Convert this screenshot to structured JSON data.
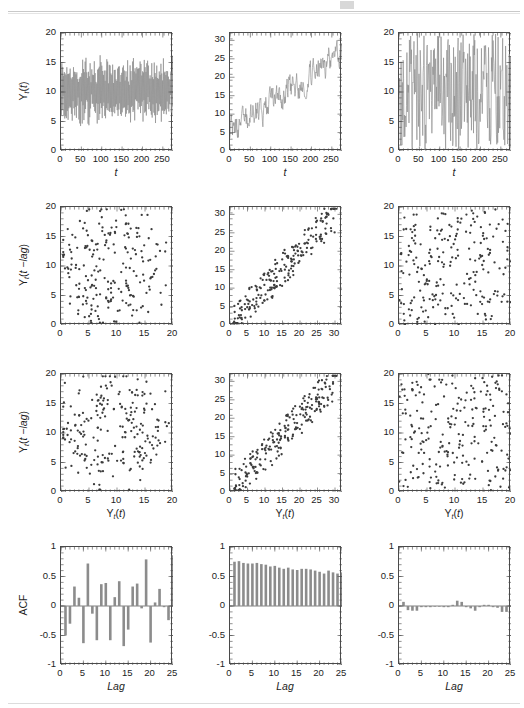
{
  "figure": {
    "type": "multi-panel-statistical-figure",
    "rows": 4,
    "cols": 3,
    "series_color": "#8c8c8c",
    "marker_color": "#3c3c3c",
    "axis_color": "#4a4a4a",
    "background": "#ffffff"
  },
  "labels": {
    "y_series": "Y",
    "y_series_sub": "t",
    "y_series_arg": "(t)",
    "y_lag": "Y",
    "y_lag_sub": "t",
    "y_lag_arg": "(t −lag)",
    "x_time": "t",
    "x_value": "Y",
    "x_value_sub": "t",
    "x_value_arg": "(t)",
    "acf": "ACF",
    "lag": "Lag"
  },
  "chart_data": [
    {
      "id": "r1c1",
      "type": "line",
      "title": "",
      "xlabel": "t",
      "ylabel": "Y_t(t)",
      "xlim": [
        0,
        275
      ],
      "ylim": [
        0,
        20
      ],
      "xticks": [
        0,
        50,
        100,
        150,
        200,
        250
      ],
      "yticks": [
        0,
        5,
        10,
        15,
        20
      ],
      "grid": false,
      "description": "stationary white-noise-like oscillating series centered near 10",
      "mean": 10.2,
      "n": 270,
      "amplitude": 9.0
    },
    {
      "id": "r1c2",
      "type": "line",
      "title": "",
      "xlabel": "t",
      "ylabel": "Y_t(t)",
      "xlim": [
        0,
        275
      ],
      "ylim": [
        0,
        32
      ],
      "xticks": [
        0,
        50,
        100,
        150,
        200,
        250
      ],
      "yticks": [
        0,
        5,
        10,
        15,
        20,
        25,
        30
      ],
      "grid": false,
      "description": "upward trending noisy random-walk series rising from about 5 to about 27",
      "start": 5,
      "end": 27,
      "n": 270,
      "noise": 3.0
    },
    {
      "id": "r1c3",
      "type": "line",
      "title": "",
      "xlabel": "t",
      "ylabel": "Y_t(t)",
      "xlim": [
        0,
        275
      ],
      "ylim": [
        0,
        20
      ],
      "xticks": [
        0,
        50,
        100,
        150,
        200,
        250
      ],
      "yticks": [
        0,
        5,
        10,
        15,
        20
      ],
      "grid": false,
      "description": "uniform random series filling the full 0 to 20 range",
      "mean": 10.0,
      "n": 270,
      "amplitude": 20.0
    },
    {
      "id": "r2c1",
      "type": "scatter",
      "title": "",
      "xlabel": "",
      "ylabel": "Y_t(t −lag)",
      "xlim": [
        0,
        20
      ],
      "ylim": [
        0,
        20
      ],
      "xticks": [
        0,
        5,
        10,
        15,
        20
      ],
      "yticks": [
        0,
        5,
        10,
        15,
        20
      ],
      "grid": false,
      "n_points": 220,
      "description": "lag-1 scatter showing curved/looping cloud structure, no simple linear trend"
    },
    {
      "id": "r2c2",
      "type": "scatter",
      "title": "",
      "xlabel": "",
      "ylabel": "Y_t(t −lag)",
      "xlim": [
        0,
        32
      ],
      "ylim": [
        0,
        32
      ],
      "xticks": [
        0,
        5,
        10,
        15,
        20,
        25,
        30
      ],
      "yticks": [
        0,
        5,
        10,
        15,
        20,
        25,
        30
      ],
      "grid": false,
      "n_points": 220,
      "description": "strong positive linear association along the diagonal"
    },
    {
      "id": "r2c3",
      "type": "scatter",
      "title": "",
      "xlabel": "",
      "ylabel": "Y_t(t −lag)",
      "xlim": [
        0,
        20
      ],
      "ylim": [
        0,
        20
      ],
      "xticks": [
        0,
        5,
        10,
        15,
        20
      ],
      "yticks": [
        0,
        5,
        10,
        15,
        20
      ],
      "grid": false,
      "n_points": 230,
      "description": "uniformly scattered cloud with no association"
    },
    {
      "id": "r3c1",
      "type": "scatter",
      "title": "",
      "xlabel": "Y_t(t)",
      "ylabel": "Y_t(t −lag)",
      "xlim": [
        0,
        20
      ],
      "ylim": [
        0,
        20
      ],
      "xticks": [
        0,
        5,
        10,
        15,
        20
      ],
      "yticks": [
        0,
        5,
        10,
        15,
        20
      ],
      "grid": false,
      "n_points": 220,
      "description": "lag-2 scatter showing weak negative / curved structure"
    },
    {
      "id": "r3c2",
      "type": "scatter",
      "title": "",
      "xlabel": "Y_t(t)",
      "ylabel": "Y_t(t −lag)",
      "xlim": [
        0,
        32
      ],
      "ylim": [
        0,
        32
      ],
      "xticks": [
        0,
        5,
        10,
        15,
        20,
        25,
        30
      ],
      "yticks": [
        0,
        5,
        10,
        15,
        20,
        25,
        30
      ],
      "grid": false,
      "n_points": 220,
      "description": "strong positive linear association along the diagonal"
    },
    {
      "id": "r3c3",
      "type": "scatter",
      "title": "",
      "xlabel": "Y_t(t)",
      "ylabel": "Y_t(t −lag)",
      "xlim": [
        0,
        20
      ],
      "ylim": [
        0,
        20
      ],
      "xticks": [
        0,
        5,
        10,
        15,
        20
      ],
      "yticks": [
        0,
        5,
        10,
        15,
        20
      ],
      "grid": false,
      "n_points": 230,
      "description": "uniformly scattered cloud with no association"
    },
    {
      "id": "r4c1",
      "type": "bar",
      "title": "",
      "xlabel": "Lag",
      "ylabel": "ACF",
      "xlim": [
        0,
        25
      ],
      "ylim": [
        -1,
        1
      ],
      "xticks": [
        0,
        5,
        10,
        15,
        20,
        25
      ],
      "yticks": [
        -1,
        -0.5,
        0,
        0.5,
        1
      ],
      "grid": false,
      "categories": [
        1,
        2,
        3,
        4,
        5,
        6,
        7,
        8,
        9,
        10,
        11,
        12,
        13,
        14,
        15,
        16,
        17,
        18,
        19,
        20,
        21,
        22,
        23,
        24,
        25
      ],
      "values": [
        -0.5,
        -0.3,
        0.33,
        0.14,
        -0.63,
        0.72,
        -0.13,
        -0.58,
        0.37,
        0.39,
        -0.58,
        0.15,
        0.42,
        -0.68,
        -0.4,
        0.33,
        0.38,
        -0.04,
        0.79,
        -0.62,
        0.06,
        0.29,
        -0.02,
        -0.24,
        0.86
      ],
      "description": "strongly oscillating ACF of a periodic/deterministic series"
    },
    {
      "id": "r4c2",
      "type": "bar",
      "title": "",
      "xlabel": "Lag",
      "ylabel": "ACF",
      "xlim": [
        0,
        25
      ],
      "ylim": [
        -1,
        1
      ],
      "xticks": [
        0,
        5,
        10,
        15,
        20,
        25
      ],
      "yticks": [
        -1,
        -0.5,
        0,
        0.5,
        1
      ],
      "grid": false,
      "categories": [
        1,
        2,
        3,
        4,
        5,
        6,
        7,
        8,
        9,
        10,
        11,
        12,
        13,
        14,
        15,
        16,
        17,
        18,
        19,
        20,
        21,
        22,
        23,
        24,
        25
      ],
      "values": [
        0.75,
        0.76,
        0.73,
        0.72,
        0.72,
        0.73,
        0.71,
        0.7,
        0.67,
        0.68,
        0.65,
        0.63,
        0.65,
        0.62,
        0.61,
        0.63,
        0.63,
        0.62,
        0.6,
        0.58,
        0.55,
        0.6,
        0.57,
        0.55,
        0.57
      ],
      "description": "slowly decaying all-positive ACF typical of a trending non-stationary series"
    },
    {
      "id": "r4c3",
      "type": "bar",
      "title": "",
      "xlabel": "Lag",
      "ylabel": "ACF",
      "xlim": [
        0,
        25
      ],
      "ylim": [
        -1,
        1
      ],
      "xticks": [
        0,
        5,
        10,
        15,
        20,
        25
      ],
      "yticks": [
        -1,
        -0.5,
        0,
        0.5,
        1
      ],
      "grid": false,
      "categories": [
        1,
        2,
        3,
        4,
        5,
        6,
        7,
        8,
        9,
        10,
        11,
        12,
        13,
        14,
        15,
        16,
        17,
        18,
        19,
        20,
        21,
        22,
        23,
        24,
        25
      ],
      "values": [
        0.07,
        -0.07,
        -0.08,
        -0.08,
        -0.02,
        -0.02,
        -0.02,
        -0.01,
        -0.01,
        -0.02,
        -0.02,
        0.02,
        0.09,
        0.07,
        -0.02,
        -0.04,
        -0.08,
        -0.02,
        0.02,
        0.02,
        -0.02,
        -0.03,
        -0.1,
        -0.1,
        -0.01
      ],
      "description": "near-zero ACF at all lags, consistent with white noise"
    }
  ]
}
